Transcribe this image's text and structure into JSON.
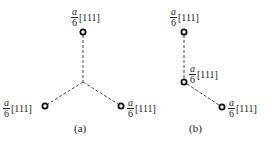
{
  "panels": [
    {
      "id": "a",
      "caption": "(a)",
      "nodes": [
        {
          "name": "top",
          "x": 83,
          "y": 32,
          "label": {
            "num": "a",
            "den": "6",
            "vec": "[111]"
          }
        },
        {
          "name": "left",
          "x": 45,
          "y": 106,
          "label": {
            "num": "a",
            "den": "6",
            "vec": "[111]"
          }
        },
        {
          "name": "right",
          "x": 121,
          "y": 106,
          "label": {
            "num": "a",
            "den": "6",
            "vec": "[111]"
          }
        }
      ],
      "junction": {
        "x": 83,
        "y": 82
      }
    },
    {
      "id": "b",
      "caption": "(b)",
      "nodes": [
        {
          "name": "top",
          "x": 184,
          "y": 32,
          "label": {
            "num": "a",
            "den": "6",
            "vec": "[111]"
          }
        },
        {
          "name": "middle",
          "x": 184,
          "y": 82,
          "label": {
            "num": "a",
            "den": "6",
            "vec": "[111]"
          }
        },
        {
          "name": "bottom-right",
          "x": 222,
          "y": 107,
          "label": {
            "num": "a",
            "den": "6",
            "vec": "[111]"
          }
        }
      ]
    }
  ],
  "colors": {
    "line": "#444444",
    "node": "#111111"
  }
}
